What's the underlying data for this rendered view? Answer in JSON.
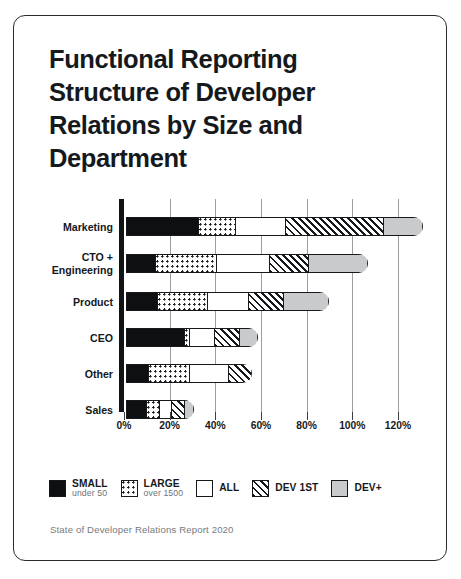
{
  "card": {
    "title": "Functional Reporting Structure of Developer Relations by Size and Department",
    "source": "State of Developer Relations Report 2020"
  },
  "legend": [
    {
      "id": "small",
      "label": "SMALL",
      "sublabel": "under 50",
      "swatch": "solid-black-swatch"
    },
    {
      "id": "large",
      "label": "LARGE",
      "sublabel": "over 1500",
      "swatch": "dotted-swatch"
    },
    {
      "id": "all",
      "label": "ALL",
      "sublabel": "",
      "swatch": "white-swatch"
    },
    {
      "id": "dev1st",
      "label": "DEV 1ST",
      "sublabel": "",
      "swatch": "hatched-swatch"
    },
    {
      "id": "devplus",
      "label": "DEV+",
      "sublabel": "",
      "swatch": "gray-swatch"
    }
  ],
  "axis": {
    "xticks": [
      "0%",
      "20%",
      "40%",
      "60%",
      "80%",
      "100%",
      "120%"
    ]
  },
  "colors": {
    "small": "#0d0f11",
    "large": "#ffffff",
    "all": "#ffffff",
    "dev1st": "#ffffff",
    "devplus": "#c8cacb",
    "outline": "#16191c",
    "text": "#16191c",
    "muted": "#767b80",
    "card_border": "#2b2b2b"
  },
  "chart_data": {
    "type": "bar",
    "orientation": "horizontal",
    "stacked": true,
    "title": "Functional Reporting Structure of Developer Relations by Size and Department",
    "subtitle": "",
    "xlabel": "",
    "ylabel": "",
    "xlim": [
      0,
      130
    ],
    "xticks": [
      0,
      20,
      40,
      60,
      80,
      100,
      120
    ],
    "xticklabels": [
      "0%",
      "20%",
      "40%",
      "60%",
      "80%",
      "100%",
      "120%"
    ],
    "grid": true,
    "legend_position": "bottom",
    "categories": [
      "Marketing",
      "CTO + Engineering",
      "Product",
      "CEO",
      "Other",
      "Sales"
    ],
    "series": [
      {
        "name": "SMALL",
        "sublabel": "under 50",
        "values": [
          32,
          13,
          14,
          26,
          10,
          9
        ]
      },
      {
        "name": "LARGE",
        "sublabel": "over 1500",
        "values": [
          16,
          27,
          22,
          2,
          18,
          6
        ]
      },
      {
        "name": "ALL",
        "sublabel": "",
        "values": [
          22,
          23,
          18,
          11,
          17,
          5
        ]
      },
      {
        "name": "DEV 1ST",
        "sublabel": "",
        "values": [
          43,
          17,
          15,
          11,
          10,
          6
        ]
      },
      {
        "name": "DEV+",
        "sublabel": "",
        "values": [
          17,
          26,
          20,
          8,
          0,
          4
        ]
      }
    ],
    "totals": [
      130,
      106,
      89,
      58,
      55,
      30
    ],
    "annotations": [
      "State of Developer Relations Report 2020"
    ]
  }
}
